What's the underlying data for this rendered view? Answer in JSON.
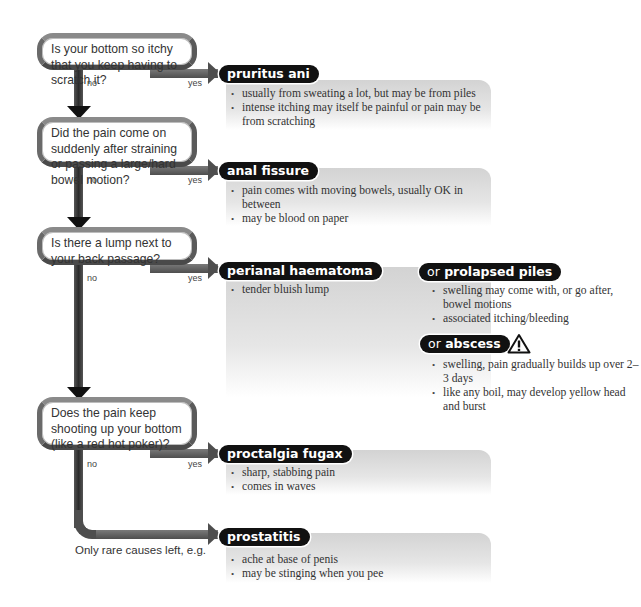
{
  "questions": [
    {
      "text": "Is your bottom so itchy that you keep having to scratch it?",
      "no": "no",
      "yes": "yes"
    },
    {
      "text": "Did the pain come on suddenly after straining or passing a large/hard bowel motion?",
      "no": "no",
      "yes": "yes"
    },
    {
      "text": "Is there a lump next to your back passage?",
      "no": "no",
      "yes": "yes"
    },
    {
      "text": "Does the pain keep shooting up your bottom (like a red hot poker)?",
      "no": "no",
      "yes": "yes"
    }
  ],
  "results": {
    "pruritus": {
      "title": "pruritus ani",
      "bullets": [
        "usually from sweating a lot, but may be from piles",
        "intense itching may itself be painful or pain may be from scratching"
      ]
    },
    "fissure": {
      "title": "anal fissure",
      "bullets": [
        "pain comes with moving bowels, usually OK in between",
        "may be blood on paper"
      ]
    },
    "haematoma": {
      "title": "perianal haematoma",
      "bullets": [
        "tender bluish lump"
      ]
    },
    "piles": {
      "or": "or",
      "title": "prolapsed piles",
      "bullets": [
        "swelling may come with, or go after, bowel motions",
        "associated itching/bleeding"
      ]
    },
    "abscess": {
      "or": "or",
      "title": "abscess",
      "warning_icon": "warning-triangle-icon",
      "bullets": [
        "swelling, pain gradually builds up over 2–3 days",
        "like any boil, may develop yellow head and burst"
      ]
    },
    "proctalgia": {
      "title": "proctalgia fugax",
      "bullets": [
        "sharp, stabbing pain",
        "comes in waves"
      ]
    },
    "prostatitis": {
      "title": "prostatitis",
      "bullets": [
        "ache at base of penis",
        "may be stinging when you pee"
      ]
    }
  },
  "footer": {
    "rare_causes": "Only rare causes left, e.g."
  }
}
